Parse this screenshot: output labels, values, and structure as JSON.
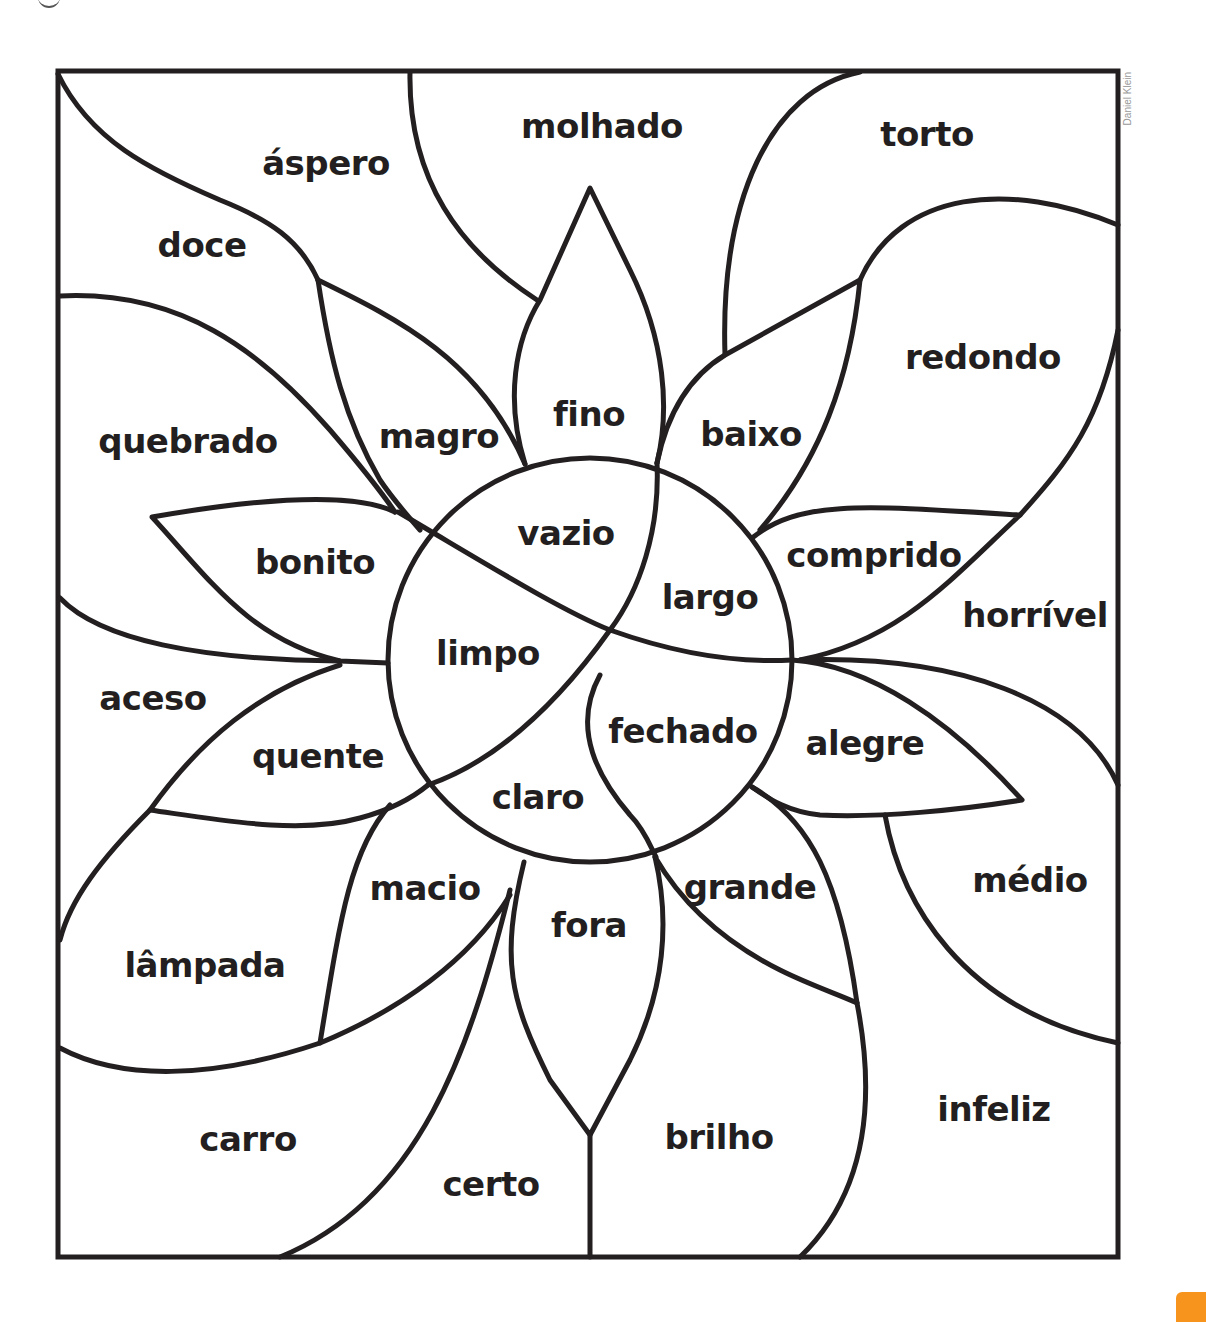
{
  "credit": "Daniel Klein",
  "accent_color": "#f7941d",
  "line_color": "#231f20",
  "center_words": [
    "vazio",
    "largo",
    "limpo",
    "fechado",
    "claro"
  ],
  "words": [
    {
      "id": "molhado",
      "label": "molhado",
      "x": 602,
      "y": 126
    },
    {
      "id": "torto",
      "label": "torto",
      "x": 927,
      "y": 134
    },
    {
      "id": "aspero",
      "label": "áspero",
      "x": 326,
      "y": 163
    },
    {
      "id": "doce",
      "label": "doce",
      "x": 202,
      "y": 245
    },
    {
      "id": "redondo",
      "label": "redondo",
      "x": 983,
      "y": 357
    },
    {
      "id": "fino",
      "label": "fino",
      "x": 589,
      "y": 414
    },
    {
      "id": "magro",
      "label": "magro",
      "x": 439,
      "y": 436
    },
    {
      "id": "quebrado",
      "label": "quebrado",
      "x": 188,
      "y": 441
    },
    {
      "id": "baixo",
      "label": "baixo",
      "x": 751,
      "y": 434
    },
    {
      "id": "vazio",
      "label": "vazio",
      "x": 566,
      "y": 533
    },
    {
      "id": "comprido",
      "label": "comprido",
      "x": 874,
      "y": 555
    },
    {
      "id": "bonito",
      "label": "bonito",
      "x": 315,
      "y": 562
    },
    {
      "id": "largo",
      "label": "largo",
      "x": 710,
      "y": 597
    },
    {
      "id": "horrivel",
      "label": "horrível",
      "x": 1035,
      "y": 615
    },
    {
      "id": "limpo",
      "label": "limpo",
      "x": 488,
      "y": 653
    },
    {
      "id": "aceso",
      "label": "aceso",
      "x": 153,
      "y": 698
    },
    {
      "id": "fechado",
      "label": "fechado",
      "x": 683,
      "y": 731
    },
    {
      "id": "alegre",
      "label": "alegre",
      "x": 865,
      "y": 743
    },
    {
      "id": "quente",
      "label": "quente",
      "x": 318,
      "y": 756
    },
    {
      "id": "claro",
      "label": "claro",
      "x": 538,
      "y": 797
    },
    {
      "id": "medio",
      "label": "médio",
      "x": 1030,
      "y": 880
    },
    {
      "id": "macio",
      "label": "macio",
      "x": 425,
      "y": 888
    },
    {
      "id": "grande",
      "label": "grande",
      "x": 750,
      "y": 887
    },
    {
      "id": "fora",
      "label": "fora",
      "x": 589,
      "y": 925
    },
    {
      "id": "lampada",
      "label": "lâmpada",
      "x": 205,
      "y": 965
    },
    {
      "id": "infeliz",
      "label": "infeliz",
      "x": 994,
      "y": 1109
    },
    {
      "id": "carro",
      "label": "carro",
      "x": 248,
      "y": 1139
    },
    {
      "id": "brilho",
      "label": "brilho",
      "x": 719,
      "y": 1137
    },
    {
      "id": "certo",
      "label": "certo",
      "x": 491,
      "y": 1184
    }
  ]
}
